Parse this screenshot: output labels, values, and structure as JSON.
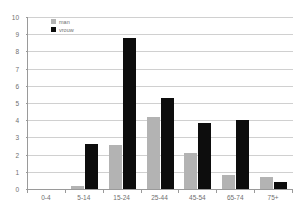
{
  "chart_data": {
    "type": "bar",
    "title": "",
    "subtitle": "",
    "xlabel": "",
    "ylabel": "",
    "ylim": [
      0,
      10
    ],
    "ytick_step": 1,
    "yticks": [
      "0",
      "1",
      "2",
      "3",
      "4",
      "5",
      "6",
      "7",
      "8",
      "9",
      "10"
    ],
    "grid": true,
    "grid_axis": "y",
    "legend_position": "top-left-inside",
    "categories": [
      "0-4",
      "5-14",
      "15-24",
      "25-44",
      "45-54",
      "65-74",
      "75+"
    ],
    "series": [
      {
        "name": "man",
        "color": "#b3b3b3",
        "values": [
          0.0,
          0.2,
          2.55,
          4.2,
          2.1,
          0.8,
          0.7
        ]
      },
      {
        "name": "vrouw",
        "color": "#0d0d0d",
        "values": [
          0.0,
          2.6,
          8.8,
          5.3,
          3.85,
          4.0,
          0.4
        ]
      }
    ]
  },
  "legend": {
    "items": [
      {
        "label": "man",
        "color": "#b3b3b3"
      },
      {
        "label": "vrouw",
        "color": "#0d0d0d"
      }
    ]
  },
  "colors": {
    "background": "#ffffff",
    "gridline": "#d0d0d0",
    "axis": "#9a9a9a",
    "tick_text": "#6f6f6f",
    "series_man": "#b3b3b3",
    "series_vrouw": "#0d0d0d"
  }
}
